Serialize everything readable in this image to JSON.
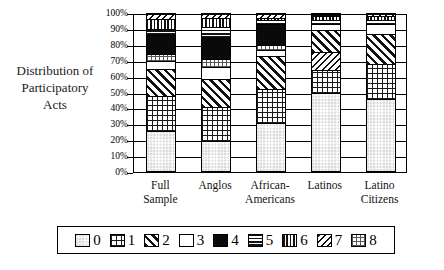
{
  "axis_title": {
    "line1": "Distribution of",
    "line2": "Participatory",
    "line3": "Acts"
  },
  "y_axis": {
    "ticks": [
      "100%",
      "90%",
      "80%",
      "70%",
      "60%",
      "50%",
      "40%",
      "30%",
      "20%",
      "10%",
      "0%"
    ],
    "min": 0,
    "max": 100
  },
  "x_labels": [
    {
      "line1": "Full",
      "line2": "Sample"
    },
    {
      "line1": "Anglos",
      "line2": ""
    },
    {
      "line1": "African-",
      "line2": "Americans"
    },
    {
      "line1": "Latinos",
      "line2": ""
    },
    {
      "line1": "Latino",
      "line2": "Citizens"
    }
  ],
  "legend": {
    "items": [
      {
        "label": "0",
        "pattern": "dense-checker-swatch"
      },
      {
        "label": "1",
        "pattern": "open-grid-swatch"
      },
      {
        "label": "2",
        "pattern": "wide-diagonal-swatch"
      },
      {
        "label": "3",
        "pattern": "speckle-swatch"
      },
      {
        "label": "4",
        "pattern": "solid-black-swatch"
      },
      {
        "label": "5",
        "pattern": "horizontal-lines-swatch"
      },
      {
        "label": "6",
        "pattern": "vertical-lines-swatch"
      },
      {
        "label": "7",
        "pattern": "narrow-diagonal-swatch"
      },
      {
        "label": "8",
        "pattern": "light-checker-swatch"
      }
    ]
  },
  "chart_data": {
    "type": "bar",
    "subtype": "stacked-100-percent",
    "title": "",
    "xlabel": "",
    "ylabel": "Distribution of Participatory Acts",
    "ylim": [
      0,
      100
    ],
    "grid": true,
    "legend_position": "bottom",
    "categories": [
      "Full Sample",
      "Anglos",
      "African-Americans",
      "Latinos",
      "Latino Citizens"
    ],
    "series": [
      {
        "name": "0",
        "values": [
          26,
          19.5,
          31,
          50,
          46
        ]
      },
      {
        "name": "1",
        "values": [
          22,
          21.5,
          21.5,
          14,
          22
        ]
      },
      {
        "name": "2",
        "values": [
          17,
          17.5,
          20.5,
          0,
          19
        ]
      },
      {
        "name": "3",
        "values": [
          5,
          7.5,
          4,
          3.5,
          6
        ]
      },
      {
        "name": "4",
        "values": [
          12,
          13,
          13,
          0,
          0
        ]
      },
      {
        "name": "5",
        "values": [
          4,
          7,
          2.5,
          2.5,
          2.5
        ]
      },
      {
        "name": "6",
        "values": [
          6,
          6,
          1.5,
          2.5,
          2
        ]
      },
      {
        "name": "7",
        "values": [
          4,
          3,
          3,
          14,
          2.5
        ]
      },
      {
        "name": "8",
        "values": [
          4,
          5,
          3,
          13.5,
          0
        ]
      }
    ]
  },
  "bars": [
    {
      "name": "Full Sample",
      "segments": [
        {
          "cat": "0",
          "from": 0,
          "to": 26
        },
        {
          "cat": "1",
          "from": 26,
          "to": 48
        },
        {
          "cat": "2",
          "from": 48,
          "to": 65
        },
        {
          "cat": "3",
          "from": 65,
          "to": 70
        },
        {
          "cat": "8",
          "from": 70,
          "to": 74
        },
        {
          "cat": "4",
          "from": 74,
          "to": 86
        },
        {
          "cat": "5",
          "from": 86,
          "to": 90
        },
        {
          "cat": "6",
          "from": 90,
          "to": 96
        },
        {
          "cat": "7",
          "from": 96,
          "to": 100
        }
      ]
    },
    {
      "name": "Anglos",
      "segments": [
        {
          "cat": "0",
          "from": 0,
          "to": 19.5
        },
        {
          "cat": "1",
          "from": 19.5,
          "to": 41
        },
        {
          "cat": "2",
          "from": 41,
          "to": 58.5
        },
        {
          "cat": "3",
          "from": 58.5,
          "to": 66
        },
        {
          "cat": "8",
          "from": 66,
          "to": 71
        },
        {
          "cat": "4",
          "from": 71,
          "to": 84
        },
        {
          "cat": "5",
          "from": 84,
          "to": 91
        },
        {
          "cat": "6",
          "from": 91,
          "to": 97
        },
        {
          "cat": "7",
          "from": 97,
          "to": 100
        }
      ]
    },
    {
      "name": "African-Americans",
      "segments": [
        {
          "cat": "0",
          "from": 0,
          "to": 31
        },
        {
          "cat": "1",
          "from": 31,
          "to": 52.5
        },
        {
          "cat": "2",
          "from": 52.5,
          "to": 73
        },
        {
          "cat": "3",
          "from": 73,
          "to": 77
        },
        {
          "cat": "8",
          "from": 77,
          "to": 80
        },
        {
          "cat": "4",
          "from": 80,
          "to": 93
        },
        {
          "cat": "5",
          "from": 93,
          "to": 95.5
        },
        {
          "cat": "6",
          "from": 95.5,
          "to": 97
        },
        {
          "cat": "7",
          "from": 97,
          "to": 100
        }
      ]
    },
    {
      "name": "Latinos",
      "segments": [
        {
          "cat": "0",
          "from": 0,
          "to": 50
        },
        {
          "cat": "1",
          "from": 50,
          "to": 64
        },
        {
          "cat": "7",
          "from": 64,
          "to": 75.5
        },
        {
          "cat": "2",
          "from": 75.5,
          "to": 89.5
        },
        {
          "cat": "3",
          "from": 89.5,
          "to": 93
        },
        {
          "cat": "5",
          "from": 93,
          "to": 95.5
        },
        {
          "cat": "6",
          "from": 95.5,
          "to": 98
        },
        {
          "cat": "4",
          "from": 98,
          "to": 100
        }
      ]
    },
    {
      "name": "Latino Citizens",
      "segments": [
        {
          "cat": "0",
          "from": 0,
          "to": 46
        },
        {
          "cat": "1",
          "from": 46,
          "to": 68
        },
        {
          "cat": "2",
          "from": 68,
          "to": 87
        },
        {
          "cat": "3",
          "from": 87,
          "to": 93
        },
        {
          "cat": "5",
          "from": 93,
          "to": 95.5
        },
        {
          "cat": "6",
          "from": 95.5,
          "to": 98
        },
        {
          "cat": "7",
          "from": 98,
          "to": 100
        }
      ]
    }
  ]
}
